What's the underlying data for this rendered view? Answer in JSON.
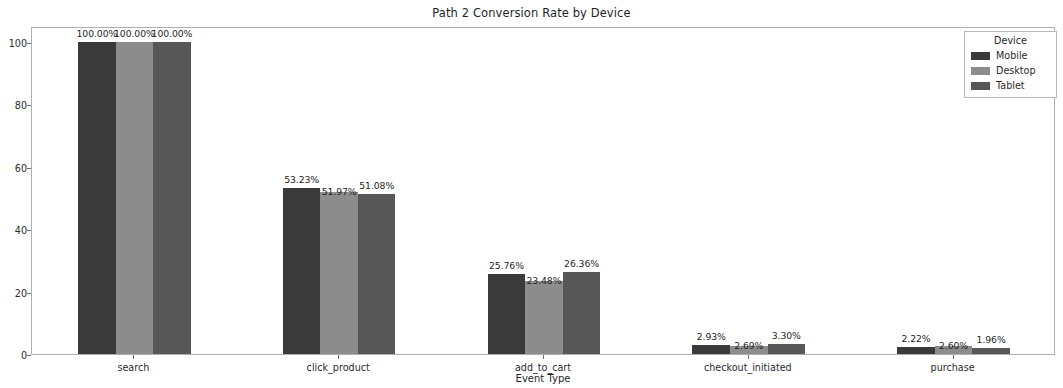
{
  "chart_data": {
    "type": "bar",
    "title": "Path 2 Conversion Rate by Device",
    "xlabel": "Event Type",
    "ylabel": "",
    "ylim": [
      0,
      105
    ],
    "yticks": [
      0,
      20,
      40,
      60,
      80,
      100
    ],
    "grid": false,
    "legend_title": "Device",
    "legend_position": "upper right",
    "categories": [
      "search",
      "click_product",
      "add_to_cart",
      "checkout_initiated",
      "purchase"
    ],
    "series": [
      {
        "name": "Mobile",
        "color": "#3a3a3a",
        "values": [
          100.0,
          53.23,
          25.76,
          2.93,
          2.22
        ],
        "labels": [
          "100.00%",
          "53.23%",
          "25.76%",
          "2.93%",
          "2.22%"
        ]
      },
      {
        "name": "Desktop",
        "color": "#8c8c8c",
        "values": [
          100.0,
          51.97,
          23.48,
          2.69,
          2.6
        ],
        "labels": [
          "100.00%",
          "51.97%",
          "23.48%",
          "2.69%",
          "2.60%"
        ]
      },
      {
        "name": "Tablet",
        "color": "#575757",
        "values": [
          100.0,
          51.08,
          26.36,
          3.3,
          1.96
        ],
        "labels": [
          "100.00%",
          "51.08%",
          "26.36%",
          "3.30%",
          "1.96%"
        ]
      }
    ]
  },
  "axis": {
    "ytick_labels": [
      "0",
      "20",
      "40",
      "60",
      "80",
      "100"
    ],
    "xtick_labels": [
      "search",
      "click_product",
      "add_to_cart",
      "checkout_initiated",
      "purchase"
    ]
  }
}
